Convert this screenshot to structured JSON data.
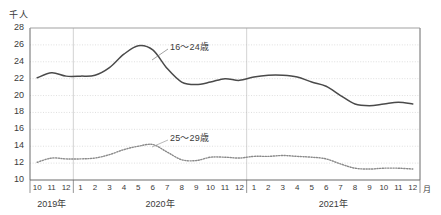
{
  "chart_data": {
    "type": "line",
    "title": "",
    "xlabel": "月",
    "ylabel": "千人",
    "unit_label": "千人",
    "month_axis_unit": "月",
    "ylim": [
      10,
      28
    ],
    "yticks": [
      28,
      26,
      24,
      22,
      20,
      18,
      16,
      14,
      12,
      10
    ],
    "grid": true,
    "legend_position": "inline-annotation",
    "x": [
      "2019-10",
      "2019-11",
      "2019-12",
      "2020-01",
      "2020-02",
      "2020-03",
      "2020-04",
      "2020-05",
      "2020-06",
      "2020-07",
      "2020-08",
      "2020-09",
      "2020-10",
      "2020-11",
      "2020-12",
      "2021-01",
      "2021-02",
      "2021-03",
      "2021-04",
      "2021-05",
      "2021-06",
      "2021-07",
      "2021-08",
      "2021-09",
      "2021-10",
      "2021-11",
      "2021-12"
    ],
    "tick_labels": [
      "10",
      "11",
      "12",
      "1",
      "2",
      "3",
      "4",
      "5",
      "6",
      "7",
      "8",
      "9",
      "10",
      "11",
      "12",
      "1",
      "2",
      "3",
      "4",
      "5",
      "6",
      "7",
      "8",
      "9",
      "10",
      "11",
      "12"
    ],
    "year_groups": [
      {
        "label": "2019年",
        "start_index": 0,
        "end_index": 2
      },
      {
        "label": "2020年",
        "start_index": 3,
        "end_index": 14
      },
      {
        "label": "2021年",
        "start_index": 15,
        "end_index": 26
      }
    ],
    "series": [
      {
        "name": "16～24歳",
        "style": "solid",
        "color": "#4a4a4a",
        "annotation": "16～24歳",
        "values": [
          22.1,
          22.7,
          22.3,
          22.3,
          22.4,
          23.3,
          24.9,
          25.9,
          25.4,
          23.2,
          21.6,
          21.3,
          21.6,
          22.0,
          21.8,
          22.2,
          22.4,
          22.4,
          22.2,
          21.6,
          21.1,
          20.0,
          19.0,
          18.8,
          19.0,
          19.2,
          19.0
        ]
      },
      {
        "name": "25～29歳",
        "style": "dotted",
        "color": "#8a8a8a",
        "annotation": "25～29歳",
        "values": [
          12.1,
          12.6,
          12.5,
          12.5,
          12.6,
          13.0,
          13.6,
          14.0,
          14.2,
          13.3,
          12.4,
          12.3,
          12.7,
          12.7,
          12.6,
          12.8,
          12.8,
          12.9,
          12.8,
          12.7,
          12.5,
          11.9,
          11.4,
          11.3,
          11.4,
          11.4,
          11.3
        ]
      }
    ]
  },
  "annotations": {
    "series1_label": "16～24歳",
    "series2_label": "25～29歳"
  }
}
